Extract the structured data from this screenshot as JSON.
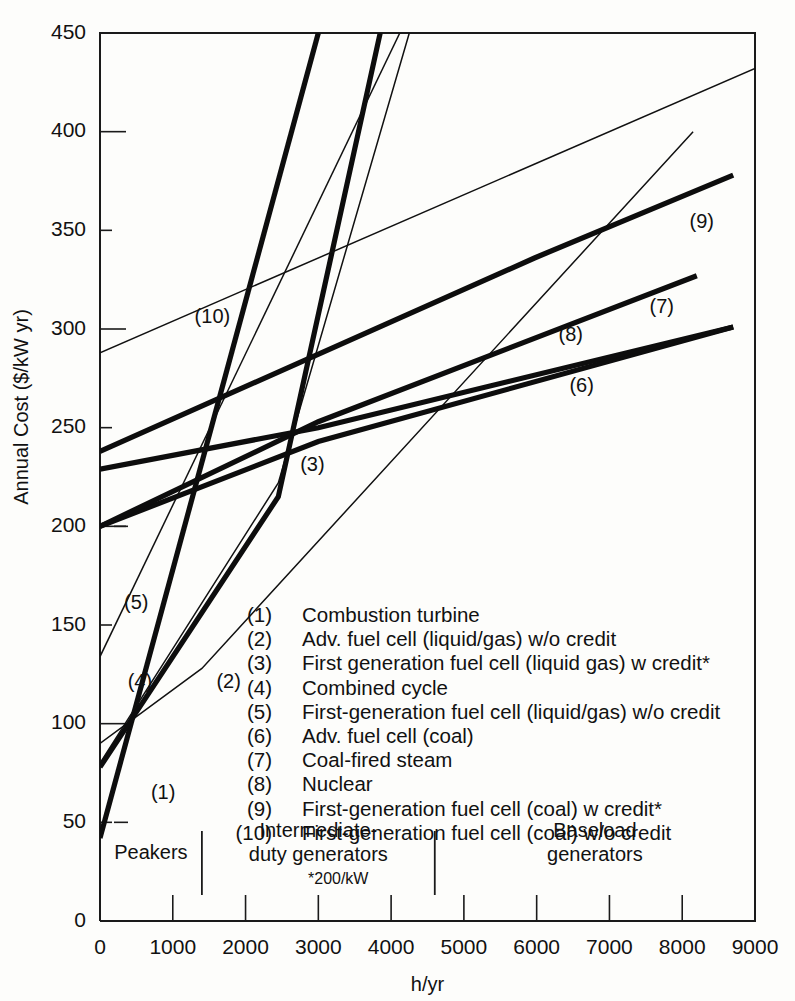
{
  "chart_data": {
    "type": "line",
    "title": "",
    "xlabel": "h/yr",
    "ylabel": "Annual Cost ($/kW yr)",
    "xlim": [
      0,
      9000
    ],
    "ylim": [
      0,
      450
    ],
    "grid": false,
    "legend_position": "inside-center",
    "xticks": [
      0,
      1000,
      2000,
      3000,
      4000,
      5000,
      6000,
      7000,
      8000,
      9000
    ],
    "yticks": [
      0,
      50,
      100,
      150,
      200,
      250,
      300,
      350,
      400,
      450
    ],
    "xtick_labels": [
      "0",
      "1000",
      "2000",
      "3000",
      "4000",
      "5000",
      "6000",
      "7000",
      "8000",
      "9000"
    ],
    "ytick_labels": [
      "0",
      "50",
      "100",
      "150",
      "200",
      "250",
      "300",
      "350",
      "400",
      "450"
    ],
    "footnote": "*200/kW",
    "bands": [
      {
        "id": "peakers",
        "label": "Peakers",
        "x_start": 0,
        "x_end": 1400
      },
      {
        "id": "intermediate",
        "label": "Intermediate-\nduty generators",
        "label_line1": "Intermediate-",
        "label_line2": "duty generators",
        "x_start": 1400,
        "x_end": 4600
      },
      {
        "id": "baseload",
        "label": "Baseload\ngenerators",
        "label_line1": "Baseload",
        "label_line2": "generators",
        "x_start": 4600,
        "x_end": 9000
      }
    ],
    "band_dividers": [
      1400,
      4600
    ],
    "series": [
      {
        "id": 1,
        "key": "(1)",
        "name": "Combustion turbine",
        "weight": "bold",
        "x": [
          0,
          3000
        ],
        "values": [
          42,
          450
        ],
        "tag_x": 700,
        "tag_y": 62
      },
      {
        "id": 2,
        "key": "(2)",
        "name": "Adv. fuel cell (liquid/gas) w/o credit",
        "weight": "thin",
        "x": [
          0,
          1400,
          8150
        ],
        "values": [
          90,
          128,
          400
        ],
        "tag_x": 1600,
        "tag_y": 118
      },
      {
        "id": 3,
        "key": "(3)",
        "name": "First generation fuel cell (liquid gas) w credit*",
        "weight": "thin",
        "x": [
          0,
          2450,
          4250
        ],
        "values": [
          80,
          222,
          450
        ],
        "tag_x": 2750,
        "tag_y": 228
      },
      {
        "id": 4,
        "key": "(4)",
        "name": "Combined cycle",
        "weight": "bold",
        "x": [
          0,
          2450,
          3850
        ],
        "values": [
          78,
          215,
          450
        ],
        "tag_x": 380,
        "tag_y": 118
      },
      {
        "id": 5,
        "key": "(5)",
        "name": "First-generation fuel cell (liquid/gas) w/o credit",
        "weight": "thin",
        "x": [
          0,
          4120
        ],
        "values": [
          134,
          450
        ],
        "tag_x": 330,
        "tag_y": 158
      },
      {
        "id": 6,
        "key": "(6)",
        "name": "Adv. fuel cell (coal)",
        "weight": "bold",
        "x": [
          0,
          3000,
          8700
        ],
        "values": [
          200,
          243,
          301
        ],
        "tag_x": 6450,
        "tag_y": 268
      },
      {
        "id": 7,
        "key": "(7)",
        "name": "Coal-fired steam",
        "weight": "bold",
        "x": [
          0,
          3000,
          8200
        ],
        "values": [
          200,
          253,
          327
        ],
        "tag_x": 7550,
        "tag_y": 308
      },
      {
        "id": 8,
        "key": "(8)",
        "name": "Nuclear",
        "weight": "bold",
        "x": [
          0,
          3000,
          8700
        ],
        "values": [
          229,
          250,
          301
        ],
        "tag_x": 6300,
        "tag_y": 294
      },
      {
        "id": 9,
        "key": "(9)",
        "name": "First-generation fuel cell (coal) w credit*",
        "weight": "bold",
        "x": [
          0,
          5970,
          8700
        ],
        "values": [
          238,
          336,
          378
        ],
        "tag_x": 8100,
        "tag_y": 351
      },
      {
        "id": 10,
        "key": "(10)",
        "name": "First-generation fuel cell (coal) w/o credit",
        "weight": "thin",
        "x": [
          0,
          9000
        ],
        "values": [
          288,
          432
        ],
        "tag_x": 1300,
        "tag_y": 303
      }
    ],
    "legend_entries": [
      {
        "num": "(1)",
        "text": "Combustion turbine"
      },
      {
        "num": "(2)",
        "text": "Adv. fuel cell (liquid/gas) w/o credit"
      },
      {
        "num": "(3)",
        "text": "First generation fuel cell (liquid gas) w credit*"
      },
      {
        "num": "(4)",
        "text": "Combined cycle"
      },
      {
        "num": "(5)",
        "text": "First-generation fuel cell (liquid/gas) w/o credit"
      },
      {
        "num": "(6)",
        "text": "Adv. fuel cell (coal)"
      },
      {
        "num": "(7)",
        "text": "Coal-fired steam"
      },
      {
        "num": "(8)",
        "text": "Nuclear"
      },
      {
        "num": "(9)",
        "text": "First-generation fuel cell (coal) w credit*"
      },
      {
        "num": "(10)",
        "text": "First-generation fuel cell (coal) w/o credit"
      }
    ]
  },
  "colors": {
    "ink": "#111111",
    "paper": "#fdfdfb"
  }
}
